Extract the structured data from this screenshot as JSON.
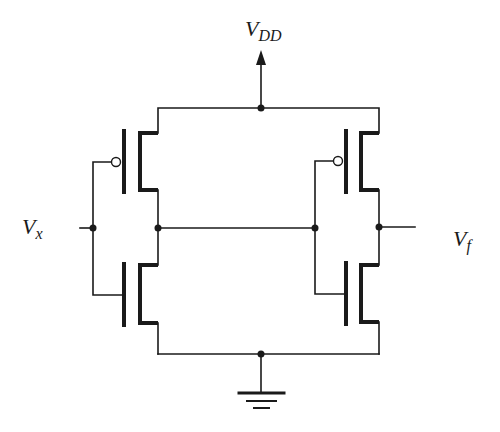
{
  "diagram": {
    "type": "circuit-schematic",
    "labels": {
      "supply": {
        "main": "V",
        "sub": "DD"
      },
      "input": {
        "main": "V",
        "sub": "x"
      },
      "output": {
        "main": "V",
        "sub": "f"
      }
    },
    "components": [
      {
        "id": "P1",
        "kind": "PMOS",
        "stage": 1
      },
      {
        "id": "N1",
        "kind": "NMOS",
        "stage": 1
      },
      {
        "id": "P2",
        "kind": "PMOS",
        "stage": 2
      },
      {
        "id": "N2",
        "kind": "NMOS",
        "stage": 2
      }
    ],
    "nodes": [
      "VDD",
      "Vx",
      "intermediate",
      "Vf",
      "GND"
    ],
    "colors": {
      "wire": "#1a1a1a",
      "background": "#ffffff"
    }
  }
}
